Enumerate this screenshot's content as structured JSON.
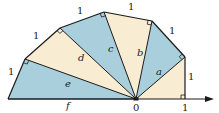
{
  "diagram": {
    "colors": {
      "blue": "#a9cfdc",
      "cream": "#f8ecd2",
      "stroke": "#1a1a1a"
    },
    "triangles": [
      {
        "name": "triangle-base",
        "fill": "cream",
        "hyp_label": ""
      },
      {
        "name": "triangle-a",
        "fill": "blue",
        "hyp_label": "a"
      },
      {
        "name": "triangle-b",
        "fill": "cream",
        "hyp_label": "b"
      },
      {
        "name": "triangle-c",
        "fill": "blue",
        "hyp_label": "c"
      },
      {
        "name": "triangle-d",
        "fill": "cream",
        "hyp_label": "d"
      },
      {
        "name": "triangle-e",
        "fill": "blue",
        "hyp_label": "e"
      }
    ],
    "unit_side_labels": [
      "1",
      "1",
      "1",
      "1",
      "1",
      "1"
    ],
    "axis": {
      "origin_label": "0",
      "unit_label": "1",
      "base_label": "f"
    }
  }
}
